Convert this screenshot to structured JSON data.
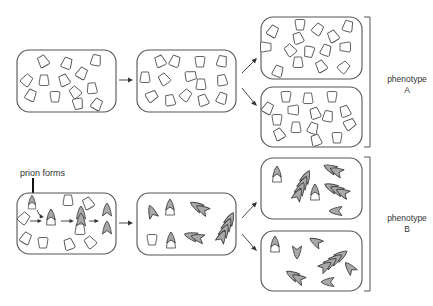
{
  "diagram": {
    "labels": {
      "prion_forms": "prion forms",
      "phenotype_a_line1": "phenotype",
      "phenotype_a_line2": "A",
      "phenotype_b_line1": "phenotype",
      "phenotype_b_line2": "B"
    },
    "rows": [
      {
        "name": "normal-protein-row",
        "stages": [
          "initial cell",
          "daughter cell",
          "progeny cell 1",
          "progeny cell 2"
        ],
        "outcome": "phenotype A"
      },
      {
        "name": "prion-row",
        "stages": [
          "cell where prion forms",
          "daughter cell with prion aggregates",
          "progeny cell 1",
          "progeny cell 2"
        ],
        "outcome": "phenotype B"
      }
    ],
    "colors": {
      "outline": "#555555",
      "prion_fill": "#a9a9a9",
      "native_fill": "#ffffff",
      "background": "#ffffff"
    }
  }
}
